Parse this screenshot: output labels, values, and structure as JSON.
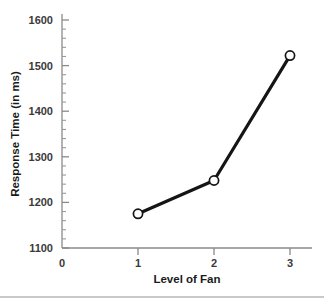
{
  "chart_data": {
    "type": "line",
    "title": "",
    "xlabel": "Level of Fan",
    "ylabel": "Response Time (in ms)",
    "x": [
      1,
      2,
      3
    ],
    "values": [
      1175,
      1248,
      1522
    ],
    "categories": [
      "1",
      "2",
      "3"
    ],
    "xlim": [
      0,
      3.35
    ],
    "ylim": [
      1100,
      1620
    ],
    "x_tick_labels": [
      "0",
      "1",
      "2",
      "3"
    ],
    "x_tick_values": [
      0,
      1,
      2,
      3
    ],
    "y_tick_labels": [
      "1100",
      "1200",
      "1300",
      "1400",
      "1500",
      "1600"
    ],
    "y_tick_values": [
      1100,
      1200,
      1300,
      1400,
      1500,
      1600
    ],
    "y_minor_step": 20,
    "grid": false,
    "legend": "none",
    "marker": "open-circle",
    "line_color": "#151515",
    "marker_fill": "#ffffff",
    "marker_edge": "#151515",
    "axis_color": "#8a8a8a",
    "background": "#ffffff"
  },
  "axes": {
    "y_title": "Response Time (in ms)",
    "x_title": "Level of Fan",
    "y_ticks": [
      {
        "label": "1600",
        "value": 1600
      },
      {
        "label": "1500",
        "value": 1500
      },
      {
        "label": "1400",
        "value": 1400
      },
      {
        "label": "1300",
        "value": 1300
      },
      {
        "label": "1200",
        "value": 1200
      },
      {
        "label": "1100",
        "value": 1100
      }
    ],
    "x_ticks": [
      {
        "label": "0",
        "value": 0
      },
      {
        "label": "1",
        "value": 1
      },
      {
        "label": "2",
        "value": 2
      },
      {
        "label": "3",
        "value": 3
      }
    ]
  }
}
